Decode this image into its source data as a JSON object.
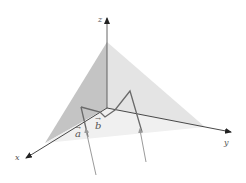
{
  "diagram": {
    "axes": {
      "x": {
        "label": "x"
      },
      "y": {
        "label": "y"
      },
      "z": {
        "label": "z"
      }
    },
    "vectors": [
      {
        "label": "a",
        "arrow": "→"
      },
      {
        "label": "b",
        "arrow": "→"
      }
    ],
    "colors": {
      "axis": "#333333",
      "plane": "#cfcfcf",
      "polyline": "#666666",
      "ray": "#9a9a9a"
    }
  }
}
